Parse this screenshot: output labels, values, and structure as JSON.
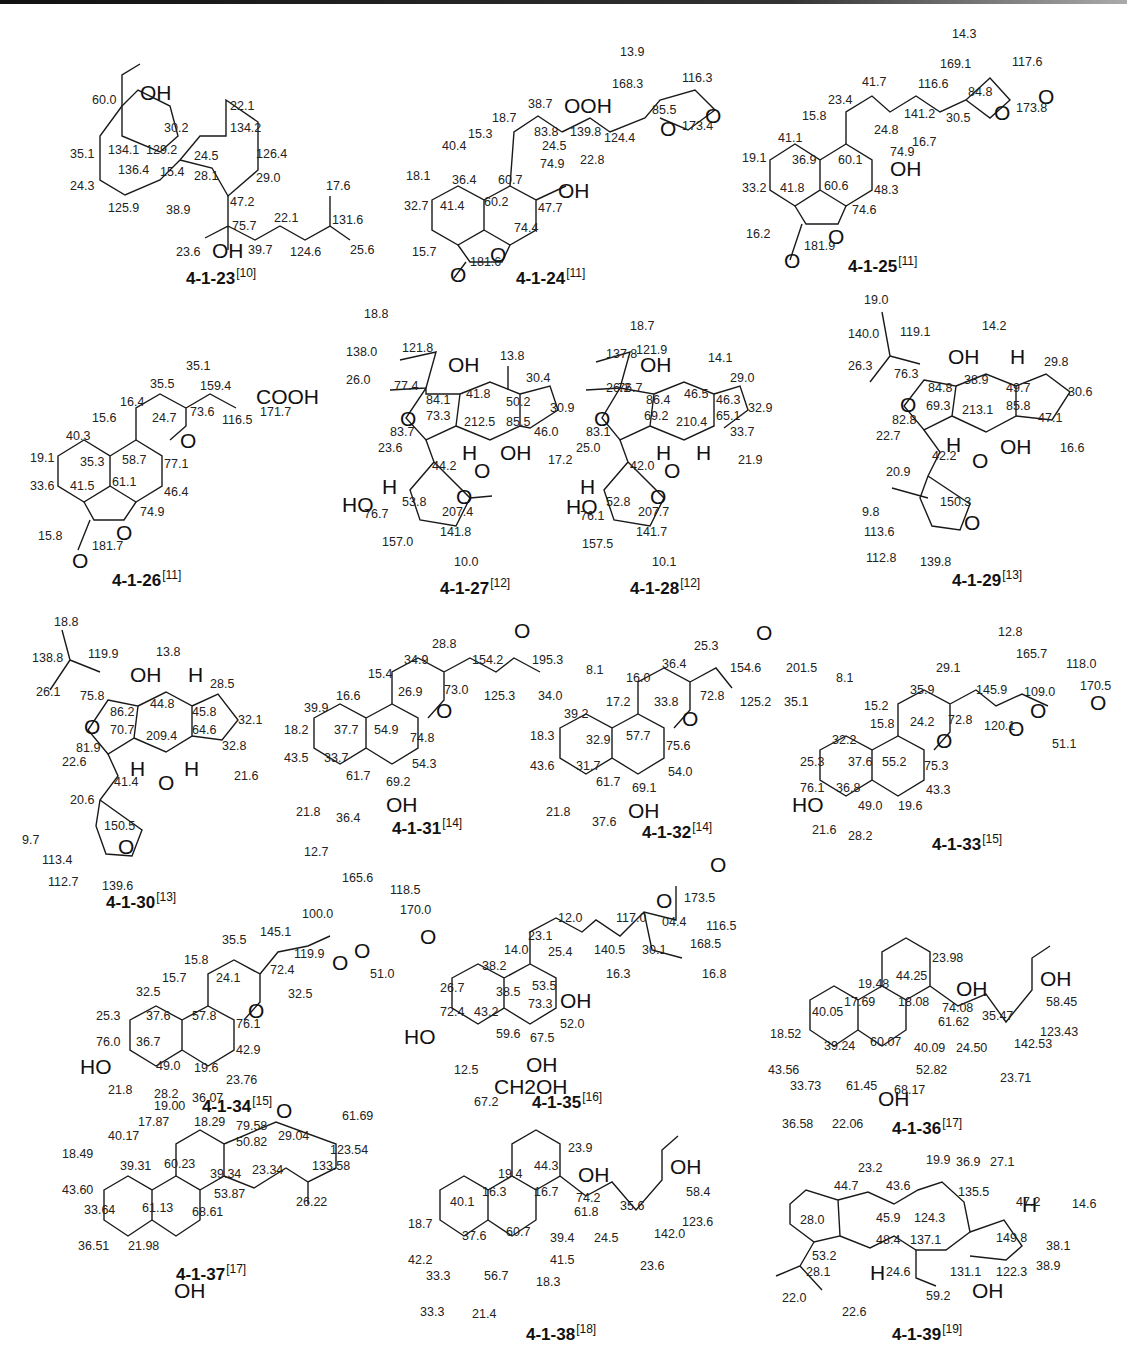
{
  "figure": {
    "compounds": [
      {
        "id": "4-1-23",
        "ref": "[10]",
        "atoms": [
          "OH",
          "OH"
        ],
        "shifts": [
          "60.0",
          "22.1",
          "30.2",
          "134.2",
          "35.1",
          "134.1",
          "129.2",
          "24.5",
          "126.4",
          "136.4",
          "15.4",
          "28.1",
          "29.0",
          "24.3",
          "17.6",
          "125.9",
          "38.9",
          "47.2",
          "22.1",
          "131.6",
          "75.7",
          "23.6",
          "39.7",
          "124.6",
          "25.6"
        ]
      },
      {
        "id": "4-1-24",
        "ref": "[11]",
        "atoms": [
          "OOH",
          "OH",
          "O",
          "O",
          "O",
          "O"
        ],
        "shifts": [
          "13.9",
          "168.3",
          "116.3",
          "38.7",
          "85.5",
          "18.7",
          "173.4",
          "15.3",
          "83.8",
          "139.8",
          "124.4",
          "24.5",
          "40.4",
          "74.9",
          "22.8",
          "18.1",
          "36.4",
          "60.7",
          "32.7",
          "41.4",
          "60.2",
          "47.7",
          "74.4",
          "15.7",
          "181.6"
        ]
      },
      {
        "id": "4-1-25",
        "ref": "[11]",
        "atoms": [
          "OH",
          "O",
          "O",
          "O",
          "O"
        ],
        "shifts": [
          "14.3",
          "169.1",
          "117.6",
          "41.7",
          "116.6",
          "84.8",
          "23.4",
          "173.8",
          "141.2",
          "30.5",
          "15.8",
          "24.8",
          "41.1",
          "16.7",
          "74.9",
          "19.1",
          "36.9",
          "60.1",
          "33.2",
          "41.8",
          "60.6",
          "48.3",
          "74.6",
          "16.2",
          "181.9"
        ]
      },
      {
        "id": "4-1-26",
        "ref": "[11]",
        "atoms": [
          "COOH",
          "O",
          "O",
          "O"
        ],
        "shifts": [
          "35.1",
          "35.5",
          "159.4",
          "16.4",
          "73.6",
          "171.7",
          "116.5",
          "15.6",
          "24.7",
          "40.3",
          "19.1",
          "35.3",
          "58.7",
          "77.1",
          "33.6",
          "41.5",
          "61.1",
          "46.4",
          "74.9",
          "15.8",
          "181.7"
        ]
      },
      {
        "id": "4-1-27",
        "ref": "[12]",
        "atoms": [
          "OH",
          "O",
          "H",
          "OH",
          "O",
          "H",
          "HO",
          "O"
        ],
        "shifts": [
          "18.8",
          "138.0",
          "121.8",
          "13.8",
          "26.0",
          "30.4",
          "77.4",
          "41.8",
          "84.1",
          "50.2",
          "30.9",
          "73.3",
          "212.5",
          "85.5",
          "83.7",
          "46.0",
          "23.6",
          "17.2",
          "44.2",
          "53.8",
          "76.7",
          "207.4",
          "141.8",
          "157.0",
          "10.0"
        ]
      },
      {
        "id": "4-1-28",
        "ref": "[12]",
        "atoms": [
          "OH",
          "O",
          "H",
          "H",
          "O",
          "H",
          "HO",
          "O"
        ],
        "shifts": [
          "18.7",
          "137.8",
          "121.9",
          "14.1",
          "26.2",
          "29.0",
          "76.7",
          "46.5",
          "46.3",
          "86.4",
          "32.9",
          "69.2",
          "210.4",
          "65.1",
          "83.1",
          "33.7",
          "25.0",
          "21.9",
          "42.0",
          "52.8",
          "76.1",
          "207.7",
          "141.7",
          "157.5",
          "10.1"
        ]
      },
      {
        "id": "4-1-29",
        "ref": "[13]",
        "atoms": [
          "OH",
          "H",
          "O",
          "H",
          "OH",
          "O",
          "O"
        ],
        "shifts": [
          "19.0",
          "140.0",
          "119.1",
          "14.2",
          "26.3",
          "29.8",
          "76.3",
          "38.9",
          "49.7",
          "84.8",
          "30.6",
          "69.3",
          "213.1",
          "85.8",
          "82.8",
          "47.1",
          "22.7",
          "16.6",
          "42.2",
          "20.9",
          "150.3",
          "9.8",
          "113.6",
          "112.8",
          "139.8"
        ]
      },
      {
        "id": "4-1-30",
        "ref": "[13]",
        "atoms": [
          "OH",
          "H",
          "O",
          "H",
          "H",
          "O",
          "O"
        ],
        "shifts": [
          "18.8",
          "138.8",
          "119.9",
          "13.8",
          "26.1",
          "28.5",
          "75.8",
          "44.8",
          "86.2",
          "45.8",
          "32.1",
          "70.7",
          "209.4",
          "64.6",
          "81.9",
          "32.8",
          "22.6",
          "21.6",
          "41.4",
          "20.6",
          "150.5",
          "9.7",
          "113.4",
          "112.7",
          "139.6"
        ]
      },
      {
        "id": "4-1-31",
        "ref": "[14]",
        "atoms": [
          "O",
          "O",
          "OH"
        ],
        "shifts": [
          "28.8",
          "34.9",
          "154.2",
          "195.3",
          "8.1",
          "15.4",
          "73.0",
          "125.3",
          "34.0",
          "16.6",
          "26.9",
          "39.9",
          "18.2",
          "37.7",
          "54.9",
          "74.8",
          "43.5",
          "33.7",
          "54.3",
          "61.7",
          "69.2",
          "21.8",
          "36.4"
        ]
      },
      {
        "id": "4-1-32",
        "ref": "[14]",
        "atoms": [
          "O",
          "O",
          "OH"
        ],
        "shifts": [
          "25.3",
          "36.4",
          "154.6",
          "201.5",
          "8.1",
          "16.0",
          "72.8",
          "125.2",
          "35.1",
          "17.2",
          "33.8",
          "39.2",
          "18.3",
          "32.9",
          "57.7",
          "75.6",
          "43.6",
          "31.7",
          "54.0",
          "61.7",
          "69.1",
          "21.8",
          "37.6"
        ]
      },
      {
        "id": "4-1-33",
        "ref": "[15]",
        "atoms": [
          "O",
          "O",
          "O",
          "O",
          "HO"
        ],
        "shifts": [
          "12.8",
          "165.7",
          "118.0",
          "29.1",
          "170.5",
          "35.9",
          "145.9",
          "109.0",
          "15.2",
          "72.8",
          "120.1",
          "51.1",
          "15.8",
          "24.2",
          "32.2",
          "25.3",
          "37.6",
          "55.2",
          "75.3",
          "76.1",
          "36.8",
          "43.3",
          "49.0",
          "19.6",
          "21.6",
          "28.2"
        ]
      },
      {
        "id": "4-1-34",
        "ref": "[15]",
        "atoms": [
          "O",
          "O",
          "O",
          "O",
          "HO"
        ],
        "shifts": [
          "12.7",
          "165.6",
          "118.5",
          "170.0",
          "100.0",
          "145.1",
          "35.5",
          "119.9",
          "51.0",
          "15.8",
          "72.4",
          "15.7",
          "24.1",
          "32.5",
          "32.5",
          "25.3",
          "37.6",
          "57.8",
          "76.1",
          "76.0",
          "36.7",
          "42.9",
          "49.0",
          "19.6",
          "21.8",
          "28.2"
        ]
      },
      {
        "id": "4-1-35",
        "ref": "[16]",
        "atoms": [
          "O",
          "O",
          "OH",
          "HO",
          "OH",
          "CH2OH"
        ],
        "shifts": [
          "173.5",
          "12.0",
          "117.0",
          "04.4",
          "116.5",
          "23.1",
          "168.5",
          "14.0",
          "140.5",
          "30.1",
          "25.4",
          "38.2",
          "16.3",
          "16.8",
          "26.7",
          "38.5",
          "53.5",
          "73.3",
          "72.4",
          "43.2",
          "52.0",
          "59.6",
          "67.5",
          "12.5",
          "67.2"
        ]
      },
      {
        "id": "4-1-36",
        "ref": "[17]",
        "atoms": [
          "OH",
          "OH",
          "OH"
        ],
        "shifts": [
          "23.98",
          "44.25",
          "19.48",
          "17.69",
          "18.08",
          "74.08",
          "58.45",
          "40.05",
          "61.62",
          "35.47",
          "18.52",
          "123.43",
          "39.24",
          "60.07",
          "40.09",
          "24.50",
          "142.53",
          "43.56",
          "52.82",
          "33.73",
          "61.45",
          "68.17",
          "23.71",
          "36.58",
          "22.06"
        ]
      },
      {
        "id": "4-1-37",
        "ref": "[17]",
        "atoms": [
          "O",
          "OH"
        ],
        "shifts": [
          "23.76",
          "36.07",
          "19.00",
          "61.69",
          "17.87",
          "18.29",
          "79.58",
          "40.17",
          "50.82",
          "29.04",
          "18.49",
          "123.54",
          "39.31",
          "60.23",
          "133.58",
          "39.34",
          "23.34",
          "43.60",
          "53.87",
          "26.22",
          "33.64",
          "61.13",
          "68.61",
          "36.51",
          "21.98"
        ]
      },
      {
        "id": "4-1-38",
        "ref": "[18]",
        "atoms": [
          "OH",
          "OH"
        ],
        "shifts": [
          "23.9",
          "44.3",
          "19.4",
          "16.3",
          "16.7",
          "74.2",
          "58.4",
          "40.1",
          "61.8",
          "35.6",
          "18.7",
          "123.6",
          "37.6",
          "60.7",
          "39.4",
          "24.5",
          "142.0",
          "42.2",
          "41.5",
          "23.6",
          "33.3",
          "56.7",
          "18.3",
          "33.3",
          "21.4"
        ]
      },
      {
        "id": "4-1-39",
        "ref": "[19]",
        "atoms": [
          "H",
          "H",
          "OH"
        ],
        "shifts": [
          "19.9",
          "36.9",
          "27.1",
          "23.2",
          "44.7",
          "43.6",
          "135.5",
          "47.2",
          "14.6",
          "28.0",
          "45.9",
          "124.3",
          "48.4",
          "137.1",
          "149.8",
          "38.1",
          "53.2",
          "28.1",
          "24.6",
          "131.1",
          "122.3",
          "38.9",
          "22.0",
          "59.2",
          "22.6"
        ]
      }
    ]
  }
}
